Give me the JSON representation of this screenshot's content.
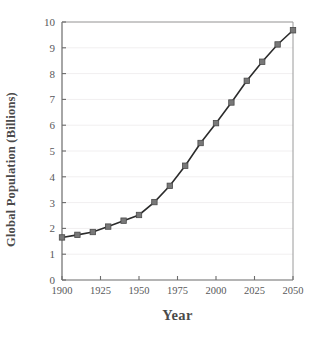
{
  "chart_data": {
    "type": "line",
    "title": "",
    "xlabel": "Year",
    "ylabel": "Global Population (Billions)",
    "xlim": [
      1900,
      2050
    ],
    "ylim": [
      0,
      10
    ],
    "xticks": [
      1900,
      1925,
      1950,
      1975,
      2000,
      2025,
      2050
    ],
    "yticks": [
      0,
      1,
      2,
      3,
      4,
      5,
      6,
      7,
      8,
      9,
      10
    ],
    "grid": "horizontal-faint",
    "legend": "none",
    "marker": "square",
    "marker_color": "#787878",
    "line_color": "#2b2b2b",
    "x": [
      1900,
      1910,
      1920,
      1930,
      1940,
      1950,
      1960,
      1970,
      1980,
      1990,
      2000,
      2010,
      2020,
      2030,
      2040,
      2050
    ],
    "values": [
      1.65,
      1.75,
      1.86,
      2.07,
      2.3,
      2.52,
      3.02,
      3.65,
      4.43,
      5.31,
      6.08,
      6.88,
      7.72,
      8.46,
      9.13,
      9.68
    ],
    "series": [
      {
        "name": "Global Population",
        "values": [
          1.65,
          1.75,
          1.86,
          2.07,
          2.3,
          2.52,
          3.02,
          3.65,
          4.43,
          5.31,
          6.08,
          6.88,
          7.72,
          8.46,
          9.13,
          9.68
        ]
      }
    ]
  },
  "axes": {
    "y_tick_labels": [
      "0",
      "1",
      "2",
      "3",
      "4",
      "5",
      "6",
      "7",
      "8",
      "9",
      "10"
    ],
    "x_tick_labels": [
      "1900",
      "1925",
      "1950",
      "1975",
      "2000",
      "2025",
      "2050"
    ]
  },
  "colors": {
    "line": "#2b2b2b",
    "marker_fill": "#787878",
    "marker_edge": "#4a4a4a",
    "axis": "#6b6b6b",
    "text": "#58585a",
    "label_text": "#4a4a4a",
    "grid": "#f1eff0",
    "background": "#ffffff"
  }
}
